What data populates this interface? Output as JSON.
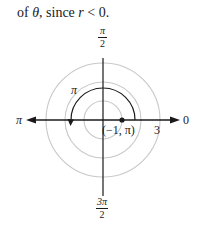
{
  "caption": {
    "prefix": "of ",
    "theta": "θ",
    "middle": ", since ",
    "r": "r",
    "suffix": " < 0."
  },
  "diagram": {
    "type": "polar-grid",
    "center": [
      103,
      120
    ],
    "circle_radii": [
      19,
      38,
      57
    ],
    "circle_color": "#c8c8c8",
    "axis_color": "#1a1a1a",
    "angle_labels": {
      "top": {
        "num": "π",
        "den": "2"
      },
      "bottom": {
        "num": "3π",
        "den": "2"
      },
      "left": "π",
      "right": "0"
    },
    "radius_label": "3",
    "arc_label": "π",
    "point": {
      "label": "(−1, π)",
      "r": -1,
      "theta": "π"
    }
  }
}
